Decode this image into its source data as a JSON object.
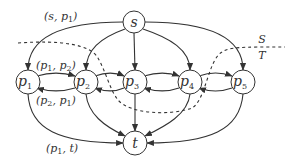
{
  "diagram": {
    "nodes": [
      {
        "id": "s",
        "label": "s",
        "x": 134,
        "y": 22
      },
      {
        "id": "p1",
        "label": "p",
        "sub": "1",
        "x": 28,
        "y": 82
      },
      {
        "id": "p2",
        "label": "p",
        "sub": "2",
        "x": 86,
        "y": 82
      },
      {
        "id": "p3",
        "label": "p",
        "sub": "3",
        "x": 135,
        "y": 82
      },
      {
        "id": "p4",
        "label": "p",
        "sub": "4",
        "x": 190,
        "y": 82
      },
      {
        "id": "p5",
        "label": "p",
        "sub": "5",
        "x": 243,
        "y": 82
      },
      {
        "id": "t",
        "label": "t",
        "x": 135,
        "y": 143
      }
    ],
    "edges": [
      {
        "from": "s",
        "to": "p1"
      },
      {
        "from": "s",
        "to": "p2"
      },
      {
        "from": "s",
        "to": "p3"
      },
      {
        "from": "s",
        "to": "p4"
      },
      {
        "from": "s",
        "to": "p5"
      },
      {
        "from": "p1",
        "to": "p2"
      },
      {
        "from": "p2",
        "to": "p1"
      },
      {
        "from": "p2",
        "to": "p3"
      },
      {
        "from": "p3",
        "to": "p2"
      },
      {
        "from": "p3",
        "to": "p4"
      },
      {
        "from": "p4",
        "to": "p3"
      },
      {
        "from": "p4",
        "to": "p5"
      },
      {
        "from": "p5",
        "to": "p4"
      },
      {
        "from": "p1",
        "to": "t"
      },
      {
        "from": "p2",
        "to": "t"
      },
      {
        "from": "p3",
        "to": "t"
      },
      {
        "from": "p4",
        "to": "t"
      },
      {
        "from": "p5",
        "to": "t"
      }
    ],
    "edge_labels": {
      "s_p1": {
        "open": "(s, p",
        "sub": "1",
        "close": ")"
      },
      "p1_p2": {
        "open": "(p",
        "sub1": "1",
        "mid": ", p",
        "sub2": "2",
        "close": ")"
      },
      "p2_p1": {
        "open": "(p",
        "sub1": "2",
        "mid": ", p",
        "sub2": "1",
        "close": ")"
      },
      "p1_t": {
        "open": "(p",
        "sub1": "1",
        "mid": ", t",
        "close": ")"
      }
    },
    "cut_labels": {
      "source_side": "S",
      "sink_side": "T"
    }
  }
}
